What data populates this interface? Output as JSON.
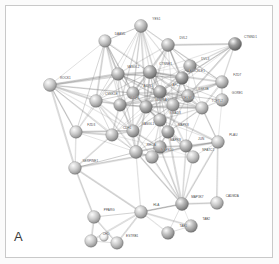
{
  "panel": {
    "letter": "A",
    "caption": "",
    "background": "#ffffff",
    "frame_color": "#c9c9c9"
  },
  "chart_data": {
    "type": "diagram",
    "subtype": "protein-protein-interaction-network",
    "title": "",
    "xlabel": "",
    "ylabel": "",
    "grid": false,
    "legend_position": "none",
    "xlim": [
      0,
      279
    ],
    "ylim": [
      0,
      264
    ],
    "style": {
      "node_shape": "sphere",
      "node_radius_px": 6.2,
      "edge_color": "#8d8d8d",
      "edge_color_strong": "#5e5e5e",
      "label_color": "#4a4a4a",
      "label_size_px": 3.1,
      "palette": [
        "#cfcfcf",
        "#bdbdbd",
        "#a8a8a8",
        "#949494",
        "#7e7e7e",
        "#6a6a6a"
      ]
    },
    "nodes": [
      {
        "id": "YES1",
        "label": "YES1",
        "x": 141,
        "y": 26,
        "r": 6.4,
        "shade": "#b3b3b3"
      },
      {
        "id": "DAAM1",
        "label": "DAAM1",
        "x": 105,
        "y": 41,
        "r": 6.2,
        "shade": "#bcbcbc"
      },
      {
        "id": "DVL2",
        "label": "DVL2",
        "x": 168,
        "y": 45,
        "r": 6.4,
        "shade": "#a9a9a9"
      },
      {
        "id": "CTNND1",
        "label": "CTNND1",
        "x": 235,
        "y": 44,
        "r": 6.5,
        "shade": "#7a7a7a"
      },
      {
        "id": "DVL3",
        "label": "DVL3",
        "x": 190,
        "y": 66,
        "r": 6.3,
        "shade": "#9b9b9b"
      },
      {
        "id": "FZD7",
        "label": "FZD7",
        "x": 222,
        "y": 82,
        "r": 6.3,
        "shade": "#b0b0b0"
      },
      {
        "id": "ROCK1",
        "label": "ROCK1",
        "x": 50,
        "y": 85,
        "r": 6.4,
        "shade": "#c2c2c2"
      },
      {
        "id": "VANGL2",
        "label": "VANGL2",
        "x": 118,
        "y": 74,
        "r": 6.3,
        "shade": "#a4a4a4"
      },
      {
        "id": "CTNNB1",
        "label": "CTNNB1",
        "x": 150,
        "y": 72,
        "r": 6.6,
        "shade": "#8f8f8f"
      },
      {
        "id": "PRICKLE1",
        "label": "PRICKLE1",
        "x": 182,
        "y": 78,
        "r": 6.3,
        "shade": "#858585"
      },
      {
        "id": "GORE1",
        "label": "GORE1",
        "x": 222,
        "y": 100,
        "r": 6.3,
        "shade": "#b4b4b4"
      },
      {
        "id": "AXIN1",
        "label": "AXIN1",
        "x": 133,
        "y": 93,
        "r": 6.2,
        "shade": "#9e9e9e"
      },
      {
        "id": "APC",
        "label": "APC",
        "x": 160,
        "y": 92,
        "r": 6.4,
        "shade": "#8a8a8a"
      },
      {
        "id": "GSK3B",
        "label": "GSK3B",
        "x": 188,
        "y": 96,
        "r": 6.3,
        "shade": "#a0a0a0"
      },
      {
        "id": "CSNK1E",
        "label": "CSNK1E",
        "x": 96,
        "y": 101,
        "r": 6.3,
        "shade": "#b8b8b8"
      },
      {
        "id": "LRP6",
        "label": "LRP6",
        "x": 120,
        "y": 105,
        "r": 6.2,
        "shade": "#9a9a9a"
      },
      {
        "id": "WNT5A",
        "label": "WNT5A",
        "x": 146,
        "y": 107,
        "r": 6.3,
        "shade": "#949494"
      },
      {
        "id": "CELSR1",
        "label": "CELSR1",
        "x": 173,
        "y": 105,
        "r": 6.2,
        "shade": "#a6a6a6"
      },
      {
        "id": "TCF7L2",
        "label": "TCF7L2",
        "x": 202,
        "y": 108,
        "r": 6.2,
        "shade": "#b6b6b6"
      },
      {
        "id": "SMAD3",
        "label": "SMAD3",
        "x": 160,
        "y": 120,
        "r": 6.3,
        "shade": "#9c9c9c"
      },
      {
        "id": "FZD3",
        "label": "FZD3",
        "x": 76,
        "y": 132,
        "r": 6.2,
        "shade": "#c0c0c0"
      },
      {
        "id": "CDH1",
        "label": "CDH1",
        "x": 112,
        "y": 135,
        "r": 6.2,
        "shade": "#b2b2b2"
      },
      {
        "id": "VANGL1",
        "label": "VANGL1",
        "x": 133,
        "y": 131,
        "r": 6.2,
        "shade": "#a2a2a2"
      },
      {
        "id": "MAPK8",
        "label": "MAPK8",
        "x": 168,
        "y": 132,
        "r": 6.3,
        "shade": "#929292"
      },
      {
        "id": "PLAU",
        "label": "PLAU",
        "x": 218,
        "y": 142,
        "r": 6.3,
        "shade": "#bababa"
      },
      {
        "id": "MAPK9",
        "label": "MAPK9",
        "x": 160,
        "y": 147,
        "r": 6.3,
        "shade": "#9d9d9d"
      },
      {
        "id": "RHOA",
        "label": "RHOA",
        "x": 136,
        "y": 152,
        "r": 6.4,
        "shade": "#aeaeae"
      },
      {
        "id": "JUN",
        "label": "JUN",
        "x": 186,
        "y": 146,
        "r": 6.2,
        "shade": "#a3a3a3"
      },
      {
        "id": "MAPK10",
        "label": "MAPK10",
        "x": 152,
        "y": 157,
        "r": 6.3,
        "shade": "#b1b1b1"
      },
      {
        "id": "NFATC1",
        "label": "NFATC1",
        "x": 193,
        "y": 157,
        "r": 6.2,
        "shade": "#bdbdbd"
      },
      {
        "id": "SERPINE1",
        "label": "SERPINE1",
        "x": 75,
        "y": 168,
        "r": 6.3,
        "shade": "#c1c1c1"
      },
      {
        "id": "MAP3K7",
        "label": "MAP3K7",
        "x": 182,
        "y": 204,
        "r": 6.4,
        "shade": "#9b9b9b"
      },
      {
        "id": "CADM2A",
        "label": "CADM2A",
        "x": 217,
        "y": 203,
        "r": 6.3,
        "shade": "#bfbfbf"
      },
      {
        "id": "HLA",
        "label": "HLA",
        "x": 141,
        "y": 212,
        "r": 6.3,
        "shade": "#bcbcbc"
      },
      {
        "id": "PPARG",
        "label": "PPARG",
        "x": 94,
        "y": 217,
        "r": 6.3,
        "shade": "#c2c2c2"
      },
      {
        "id": "TAB2",
        "label": "TAB2",
        "x": 191,
        "y": 226,
        "r": 6.3,
        "shade": "#a5a5a5"
      },
      {
        "id": "TAB1",
        "label": "TAB1",
        "x": 168,
        "y": 233,
        "r": 6.3,
        "shade": "#a9a9a9"
      },
      {
        "id": "CHD",
        "label": "CHD",
        "x": 91,
        "y": 241,
        "r": 6.2,
        "shade": "#c4c4c4"
      },
      {
        "id": "ESTRB1",
        "label": "ESTRB1",
        "x": 117,
        "y": 243,
        "r": 6.2,
        "shade": "#bdbdbd"
      },
      {
        "id": "NODE_X1",
        "label": "",
        "x": 104,
        "y": 237,
        "r": 4.2,
        "shade": "#f2f2f2"
      }
    ],
    "edges": [
      [
        "YES1",
        "DAAM1"
      ],
      [
        "YES1",
        "DVL2"
      ],
      [
        "YES1",
        "VANGL2"
      ],
      [
        "YES1",
        "CTNNB1"
      ],
      [
        "YES1",
        "AXIN1"
      ],
      [
        "YES1",
        "APC"
      ],
      [
        "YES1",
        "LRP6"
      ],
      [
        "YES1",
        "CSNK1E"
      ],
      [
        "YES1",
        "PRICKLE1"
      ],
      [
        "YES1",
        "WNT5A"
      ],
      [
        "YES1",
        "CELSR1"
      ],
      [
        "DAAM1",
        "VANGL2"
      ],
      [
        "DAAM1",
        "CTNNB1"
      ],
      [
        "DAAM1",
        "AXIN1"
      ],
      [
        "DAAM1",
        "ROCK1"
      ],
      [
        "DAAM1",
        "CSNK1E"
      ],
      [
        "DAAM1",
        "LRP6"
      ],
      [
        "DAAM1",
        "RHOA"
      ],
      [
        "DAAM1",
        "FZD3"
      ],
      [
        "DVL2",
        "DVL3"
      ],
      [
        "DVL2",
        "CTNNB1"
      ],
      [
        "DVL2",
        "PRICKLE1"
      ],
      [
        "DVL2",
        "APC"
      ],
      [
        "DVL2",
        "GSK3B"
      ],
      [
        "DVL2",
        "FZD7"
      ],
      [
        "DVL2",
        "CTNND1"
      ],
      [
        "DVL2",
        "AXIN1"
      ],
      [
        "DVL2",
        "VANGL2"
      ],
      [
        "DVL2",
        "CELSR1"
      ],
      [
        "DVL2",
        "WNT5A"
      ],
      [
        "CTNND1",
        "FZD7"
      ],
      [
        "CTNND1",
        "CTNNB1"
      ],
      [
        "CTNND1",
        "PRICKLE1"
      ],
      [
        "CTNND1",
        "GSK3B"
      ],
      [
        "CTNND1",
        "APC"
      ],
      [
        "CTNND1",
        "DVL3"
      ],
      [
        "CTNND1",
        "CDH1"
      ],
      [
        "DVL3",
        "PRICKLE1"
      ],
      [
        "DVL3",
        "GSK3B"
      ],
      [
        "DVL3",
        "FZD7"
      ],
      [
        "DVL3",
        "APC"
      ],
      [
        "DVL3",
        "CTNNB1"
      ],
      [
        "DVL3",
        "AXIN1"
      ],
      [
        "DVL3",
        "CELSR1"
      ],
      [
        "DVL3",
        "TCF7L2"
      ],
      [
        "FZD7",
        "GSK3B"
      ],
      [
        "FZD7",
        "GORE1"
      ],
      [
        "FZD7",
        "CTNNB1"
      ],
      [
        "FZD7",
        "LRP6"
      ],
      [
        "FZD7",
        "WNT5A"
      ],
      [
        "FZD7",
        "TCF7L2"
      ],
      [
        "ROCK1",
        "VANGL2"
      ],
      [
        "ROCK1",
        "CSNK1E"
      ],
      [
        "ROCK1",
        "FZD3"
      ],
      [
        "ROCK1",
        "RHOA"
      ],
      [
        "ROCK1",
        "CTNNB1"
      ],
      [
        "ROCK1",
        "AXIN1"
      ],
      [
        "ROCK1",
        "LRP6"
      ],
      [
        "ROCK1",
        "SERPINE1"
      ],
      [
        "ROCK1",
        "CDH1"
      ],
      [
        "ROCK1",
        "VANGL1"
      ],
      [
        "VANGL2",
        "CTNNB1"
      ],
      [
        "VANGL2",
        "AXIN1"
      ],
      [
        "VANGL2",
        "CSNK1E"
      ],
      [
        "VANGL2",
        "LRP6"
      ],
      [
        "VANGL2",
        "PRICKLE1"
      ],
      [
        "VANGL2",
        "CELSR1"
      ],
      [
        "VANGL2",
        "VANGL1"
      ],
      [
        "VANGL2",
        "APC"
      ],
      [
        "VANGL2",
        "WNT5A"
      ],
      [
        "VANGL2",
        "FZD3"
      ],
      [
        "CTNNB1",
        "APC"
      ],
      [
        "CTNNB1",
        "AXIN1"
      ],
      [
        "CTNNB1",
        "GSK3B"
      ],
      [
        "CTNNB1",
        "LRP6"
      ],
      [
        "CTNNB1",
        "TCF7L2"
      ],
      [
        "CTNNB1",
        "CDH1"
      ],
      [
        "CTNNB1",
        "WNT5A"
      ],
      [
        "CTNNB1",
        "CSNK1E"
      ],
      [
        "CTNNB1",
        "PRICKLE1"
      ],
      [
        "CTNNB1",
        "SMAD3"
      ],
      [
        "CTNNB1",
        "CELSR1"
      ],
      [
        "CTNNB1",
        "JUN"
      ],
      [
        "PRICKLE1",
        "GSK3B"
      ],
      [
        "PRICKLE1",
        "APC"
      ],
      [
        "PRICKLE1",
        "CELSR1"
      ],
      [
        "PRICKLE1",
        "VANGL1"
      ],
      [
        "PRICKLE1",
        "TCF7L2"
      ],
      [
        "PRICKLE1",
        "MAPK8"
      ],
      [
        "GORE1",
        "GSK3B"
      ],
      [
        "GORE1",
        "TCF7L2"
      ],
      [
        "GORE1",
        "PLAU"
      ],
      [
        "GORE1",
        "CTNNB1"
      ],
      [
        "AXIN1",
        "APC"
      ],
      [
        "AXIN1",
        "GSK3B"
      ],
      [
        "AXIN1",
        "LRP6"
      ],
      [
        "AXIN1",
        "CSNK1E"
      ],
      [
        "AXIN1",
        "TCF7L2"
      ],
      [
        "AXIN1",
        "WNT5A"
      ],
      [
        "AXIN1",
        "SMAD3"
      ],
      [
        "AXIN1",
        "VANGL1"
      ],
      [
        "APC",
        "GSK3B"
      ],
      [
        "APC",
        "LRP6"
      ],
      [
        "APC",
        "TCF7L2"
      ],
      [
        "APC",
        "CDH1"
      ],
      [
        "APC",
        "SMAD3"
      ],
      [
        "APC",
        "WNT5A"
      ],
      [
        "APC",
        "CELSR1"
      ],
      [
        "APC",
        "MAPK8"
      ],
      [
        "GSK3B",
        "TCF7L2"
      ],
      [
        "GSK3B",
        "LRP6"
      ],
      [
        "GSK3B",
        "SMAD3"
      ],
      [
        "GSK3B",
        "MAPK8"
      ],
      [
        "GSK3B",
        "JUN"
      ],
      [
        "GSK3B",
        "WNT5A"
      ],
      [
        "CSNK1E",
        "LRP6"
      ],
      [
        "CSNK1E",
        "WNT5A"
      ],
      [
        "CSNK1E",
        "FZD3"
      ],
      [
        "CSNK1E",
        "VANGL1"
      ],
      [
        "CSNK1E",
        "CDH1"
      ],
      [
        "CSNK1E",
        "RHOA"
      ],
      [
        "LRP6",
        "WNT5A"
      ],
      [
        "LRP6",
        "TCF7L2"
      ],
      [
        "LRP6",
        "VANGL1"
      ],
      [
        "LRP6",
        "CDH1"
      ],
      [
        "WNT5A",
        "CELSR1"
      ],
      [
        "WNT5A",
        "TCF7L2"
      ],
      [
        "WNT5A",
        "SMAD3"
      ],
      [
        "WNT5A",
        "MAPK8"
      ],
      [
        "WNT5A",
        "RHOA"
      ],
      [
        "WNT5A",
        "VANGL1"
      ],
      [
        "WNT5A",
        "PLAU"
      ],
      [
        "CELSR1",
        "TCF7L2"
      ],
      [
        "CELSR1",
        "SMAD3"
      ],
      [
        "CELSR1",
        "VANGL1"
      ],
      [
        "CELSR1",
        "MAPK8"
      ],
      [
        "TCF7L2",
        "SMAD3"
      ],
      [
        "TCF7L2",
        "JUN"
      ],
      [
        "TCF7L2",
        "PLAU"
      ],
      [
        "TCF7L2",
        "MAPK8"
      ],
      [
        "SMAD3",
        "MAPK8"
      ],
      [
        "SMAD3",
        "MAPK9"
      ],
      [
        "SMAD3",
        "JUN"
      ],
      [
        "SMAD3",
        "RHOA"
      ],
      [
        "SMAD3",
        "NFATC1"
      ],
      [
        "SMAD3",
        "MAPK10"
      ],
      [
        "SMAD3",
        "PLAU"
      ],
      [
        "FZD3",
        "CDH1"
      ],
      [
        "FZD3",
        "VANGL1"
      ],
      [
        "FZD3",
        "SERPINE1"
      ],
      [
        "FZD3",
        "RHOA"
      ],
      [
        "CDH1",
        "VANGL1"
      ],
      [
        "CDH1",
        "RHOA"
      ],
      [
        "CDH1",
        "SERPINE1"
      ],
      [
        "CDH1",
        "MAPK9"
      ],
      [
        "VANGL1",
        "RHOA"
      ],
      [
        "VANGL1",
        "MAPK9"
      ],
      [
        "VANGL1",
        "MAPK10"
      ],
      [
        "MAPK8",
        "MAPK9"
      ],
      [
        "MAPK8",
        "MAPK10"
      ],
      [
        "MAPK8",
        "JUN"
      ],
      [
        "MAPK8",
        "NFATC1"
      ],
      [
        "MAPK8",
        "MAP3K7"
      ],
      [
        "MAPK8",
        "RHOA"
      ],
      [
        "MAPK9",
        "MAPK10"
      ],
      [
        "MAPK9",
        "JUN"
      ],
      [
        "MAPK9",
        "NFATC1"
      ],
      [
        "MAPK9",
        "MAP3K7"
      ],
      [
        "MAPK9",
        "RHOA"
      ],
      [
        "MAPK10",
        "JUN"
      ],
      [
        "MAPK10",
        "NFATC1"
      ],
      [
        "MAPK10",
        "MAP3K7"
      ],
      [
        "MAPK10",
        "RHOA"
      ],
      [
        "JUN",
        "NFATC1"
      ],
      [
        "JUN",
        "PLAU"
      ],
      [
        "JUN",
        "MAP3K7"
      ],
      [
        "NFATC1",
        "PLAU"
      ],
      [
        "NFATC1",
        "MAP3K7"
      ],
      [
        "PLAU",
        "SERPINE1"
      ],
      [
        "PLAU",
        "CADM2A"
      ],
      [
        "PLAU",
        "MAP3K7"
      ],
      [
        "RHOA",
        "SERPINE1"
      ],
      [
        "RHOA",
        "MAP3K7"
      ],
      [
        "RHOA",
        "HLA"
      ],
      [
        "SERPINE1",
        "PPARG"
      ],
      [
        "SERPINE1",
        "HLA"
      ],
      [
        "MAP3K7",
        "CADM2A"
      ],
      [
        "MAP3K7",
        "TAB2"
      ],
      [
        "MAP3K7",
        "TAB1"
      ],
      [
        "MAP3K7",
        "HLA"
      ],
      [
        "TAB2",
        "TAB1"
      ],
      [
        "TAB2",
        "HLA"
      ],
      [
        "TAB1",
        "HLA"
      ],
      [
        "HLA",
        "PPARG"
      ],
      [
        "HLA",
        "CHD"
      ],
      [
        "HLA",
        "ESTRB1"
      ],
      [
        "PPARG",
        "CHD"
      ],
      [
        "PPARG",
        "ESTRB1"
      ],
      [
        "CHD",
        "ESTRB1"
      ]
    ]
  }
}
